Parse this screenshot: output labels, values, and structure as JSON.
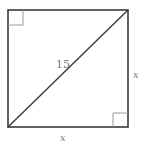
{
  "diagram": {
    "type": "square-with-diagonal",
    "diagonal_label": "15",
    "right_side_label": "x",
    "bottom_side_label": "x",
    "right_angle_markers": [
      "top-left",
      "bottom-right"
    ],
    "colors": {
      "stroke": "#3a3a3a",
      "marker": "#9a9a9a",
      "label": "#7a7a7a",
      "background": "#ffffff"
    }
  }
}
